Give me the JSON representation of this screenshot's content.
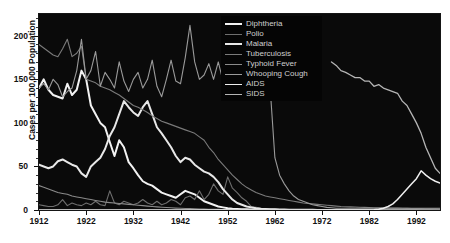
{
  "title_strip": "",
  "axes": {
    "ylabel": "Cases per 100,000 Population",
    "yticks": [
      0,
      50,
      100,
      150,
      200
    ],
    "xticks": [
      1912,
      1922,
      1932,
      1942,
      1952,
      1962,
      1972,
      1982,
      1992
    ],
    "xlim": [
      1912,
      1997
    ],
    "ylim": [
      0,
      225
    ],
    "plot_bg": "#0a0a0a",
    "tick_color": "#111111"
  },
  "legend": {
    "position": "top-center-right",
    "background": "#050505",
    "items": [
      {
        "label": "Diphtheria",
        "color": "#f2f2f2",
        "width": 2.0
      },
      {
        "label": "Polio",
        "color": "#6e6e6e",
        "width": 1.1
      },
      {
        "label": "Malaria",
        "color": "#e8e8e8",
        "width": 2.0
      },
      {
        "label": "Tuberculosis",
        "color": "#7a7a7a",
        "width": 1.1
      },
      {
        "label": "Typhoid Fever",
        "color": "#8a8a8a",
        "width": 1.1
      },
      {
        "label": "Whooping Cough",
        "color": "#9a9a9a",
        "width": 1.1
      },
      {
        "label": "AIDS",
        "color": "#efefef",
        "width": 1.5
      },
      {
        "label": "SIDS",
        "color": "#b5b5b5",
        "width": 1.3
      }
    ]
  },
  "chart_data": {
    "type": "line",
    "title": "",
    "xlabel": "",
    "ylabel": "Cases per 100,000 Population",
    "xlim": [
      1912,
      1997
    ],
    "ylim": [
      0,
      225
    ],
    "grid": false,
    "legend_position": "upper center",
    "x": [
      1912,
      1913,
      1914,
      1915,
      1916,
      1917,
      1918,
      1919,
      1920,
      1921,
      1922,
      1923,
      1924,
      1925,
      1926,
      1927,
      1928,
      1929,
      1930,
      1931,
      1932,
      1933,
      1934,
      1935,
      1936,
      1937,
      1938,
      1939,
      1940,
      1941,
      1942,
      1943,
      1944,
      1945,
      1946,
      1947,
      1948,
      1949,
      1950,
      1951,
      1952,
      1953,
      1954,
      1955,
      1956,
      1957,
      1958,
      1959,
      1960,
      1961,
      1962,
      1963,
      1964,
      1965,
      1966,
      1967,
      1968,
      1969,
      1970,
      1971,
      1972,
      1973,
      1974,
      1975,
      1976,
      1977,
      1978,
      1979,
      1980,
      1981,
      1982,
      1983,
      1984,
      1985,
      1986,
      1987,
      1988,
      1989,
      1990,
      1991,
      1992,
      1993,
      1994,
      1995,
      1996,
      1997
    ],
    "series": [
      {
        "name": "Diphtheria",
        "color": "#f2f2f2",
        "values": [
          140,
          150,
          138,
          132,
          130,
          128,
          145,
          132,
          138,
          160,
          150,
          120,
          110,
          100,
          95,
          78,
          62,
          80,
          72,
          55,
          48,
          40,
          33,
          30,
          28,
          24,
          20,
          18,
          16,
          14,
          18,
          22,
          20,
          18,
          14,
          10,
          8,
          6,
          4,
          3,
          2,
          1.5,
          1.2,
          1.0,
          0.8,
          0.6,
          0.5,
          0.4,
          0.3,
          0.2,
          0.2,
          0.1,
          0.1,
          0.1,
          0.1,
          0.1,
          0.1,
          0.1,
          0.1,
          0.05,
          0.05,
          0.02,
          0.02,
          0.01,
          0.01,
          0.01,
          0.01,
          0.01,
          0.01,
          0.01,
          0.01,
          0.01,
          0.01,
          0.01,
          0.01,
          0.01,
          0.01,
          0.01,
          0.01,
          0.01,
          0.01,
          0.01,
          0.01,
          0.01,
          0.01,
          0.01
        ]
      },
      {
        "name": "Polio",
        "color": "#6e6e6e",
        "values": [
          6,
          5,
          4,
          4,
          6,
          12,
          5,
          8,
          6,
          5,
          8,
          6,
          10,
          6,
          5,
          22,
          8,
          6,
          10,
          8,
          6,
          8,
          12,
          8,
          6,
          10,
          6,
          8,
          12,
          10,
          6,
          14,
          16,
          12,
          22,
          12,
          18,
          30,
          22,
          18,
          38,
          25,
          20,
          14,
          10,
          4,
          3,
          2,
          1,
          0.8,
          0.5,
          0.3,
          0.1,
          0.05,
          0.02,
          0.02,
          0.01,
          0.01,
          0.01,
          0.01,
          0.01,
          0.01,
          0.01,
          0.01,
          0.01,
          0.01,
          0.01,
          0.01,
          0.01,
          0.01,
          0.01,
          0.01,
          0.01,
          0.01,
          0.01,
          0.01,
          0.01,
          0.01,
          0.01,
          0.01,
          0.01,
          0.01,
          0.01,
          0.01,
          0.01,
          0.01
        ]
      },
      {
        "name": "Malaria",
        "color": "#e8e8e8",
        "values": [
          52,
          50,
          48,
          50,
          56,
          58,
          55,
          52,
          50,
          42,
          38,
          50,
          55,
          60,
          70,
          85,
          95,
          110,
          125,
          118,
          112,
          108,
          118,
          125,
          110,
          95,
          88,
          80,
          72,
          62,
          55,
          60,
          58,
          52,
          48,
          44,
          42,
          38,
          32,
          24,
          18,
          12,
          8,
          6,
          4,
          3,
          2,
          1.5,
          1.2,
          1.0,
          0.8,
          0.6,
          0.5,
          0.4,
          0.3,
          0.3,
          0.2,
          0.2,
          0.2,
          0.1,
          0.1,
          0.1,
          0.1,
          0.1,
          0.1,
          0.1,
          0.1,
          0.1,
          0.1,
          0.1,
          0.1,
          0.1,
          0.1,
          0.1,
          0.1,
          0.1,
          0.1,
          0.1,
          0.1,
          0.1,
          0.1,
          0.1,
          0.1,
          0.1,
          0.1,
          0.1
        ]
      },
      {
        "name": "Tuberculosis",
        "color": "#7a7a7a",
        "values": [
          190,
          186,
          182,
          178,
          176,
          185,
          196,
          176,
          180,
          188,
          150,
          148,
          146,
          142,
          140,
          138,
          135,
          132,
          128,
          124,
          120,
          118,
          115,
          112,
          108,
          105,
          102,
          100,
          98,
          96,
          94,
          92,
          90,
          88,
          84,
          80,
          72,
          66,
          58,
          52,
          46,
          40,
          35,
          30,
          26,
          23,
          20,
          18,
          16,
          15,
          14,
          13,
          12,
          11,
          10,
          9,
          8,
          7.5,
          7,
          6.5,
          6,
          5.5,
          5,
          4.5,
          4,
          3.8,
          3.6,
          3.4,
          3.2,
          3.0,
          2.8,
          2.6,
          2.5,
          2.4,
          2.3,
          2.2,
          2.1,
          2.0,
          1.9,
          1.8,
          1.7,
          1.6,
          1.5,
          1.4,
          1.3,
          1.2
        ]
      },
      {
        "name": "Typhoid Fever",
        "color": "#8a8a8a",
        "values": [
          28,
          26,
          24,
          22,
          20,
          19,
          18,
          16,
          15,
          14,
          13,
          12,
          11,
          10,
          9,
          8.5,
          8,
          7.5,
          7,
          6.5,
          6,
          5.5,
          5,
          4.5,
          4,
          3.6,
          3.2,
          2.8,
          2.5,
          2.2,
          2.0,
          1.8,
          1.6,
          1.4,
          1.2,
          1.0,
          0.9,
          0.8,
          0.7,
          0.6,
          0.5,
          0.45,
          0.4,
          0.35,
          0.3,
          0.28,
          0.26,
          0.24,
          0.22,
          0.2,
          0.2,
          0.18,
          0.16,
          0.15,
          0.14,
          0.13,
          0.12,
          0.11,
          0.1,
          0.1,
          0.1,
          0.1,
          0.1,
          0.1,
          0.1,
          0.1,
          0.1,
          0.1,
          0.1,
          0.1,
          0.1,
          0.1,
          0.1,
          0.1,
          0.1,
          0.1,
          0.1,
          0.1,
          0.1,
          0.1,
          0.1,
          0.1,
          0.1,
          0.1,
          0.1,
          0.1
        ]
      },
      {
        "name": "Whooping Cough",
        "color": "#9a9a9a",
        "values": [
          140,
          145,
          138,
          150,
          144,
          130,
          136,
          140,
          160,
          196,
          150,
          160,
          182,
          142,
          158,
          150,
          140,
          170,
          148,
          136,
          150,
          158,
          140,
          150,
          172,
          142,
          130,
          150,
          172,
          148,
          145,
          175,
          212,
          170,
          150,
          155,
          168,
          150,
          170,
          148,
          160,
          175,
          168,
          150,
          172,
          162,
          150,
          170,
          145,
          140,
          60,
          40,
          30,
          22,
          16,
          12,
          10,
          8,
          6,
          5,
          4,
          3,
          2.5,
          2,
          2,
          2,
          2,
          2,
          2,
          2,
          2,
          2,
          2,
          2,
          2,
          2,
          2,
          2,
          2,
          2,
          2,
          2,
          2,
          2,
          2,
          2
        ]
      },
      {
        "name": "AIDS",
        "color": "#efefef",
        "values": [
          0,
          0,
          0,
          0,
          0,
          0,
          0,
          0,
          0,
          0,
          0,
          0,
          0,
          0,
          0,
          0,
          0,
          0,
          0,
          0,
          0,
          0,
          0,
          0,
          0,
          0,
          0,
          0,
          0,
          0,
          0,
          0,
          0,
          0,
          0,
          0,
          0,
          0,
          0,
          0,
          0,
          0,
          0,
          0,
          0,
          0,
          0,
          0,
          0,
          0,
          0,
          0,
          0,
          0,
          0,
          0,
          0,
          0,
          0,
          0,
          0,
          0,
          0,
          0,
          0,
          0,
          0,
          0,
          0,
          0,
          0.1,
          0.3,
          0.8,
          2,
          4,
          7,
          12,
          18,
          24,
          30,
          36,
          45,
          40,
          36,
          33,
          31
        ]
      },
      {
        "name": "SIDS",
        "color": "#b5b5b5",
        "values": [
          null,
          null,
          null,
          null,
          null,
          null,
          null,
          null,
          null,
          null,
          null,
          null,
          null,
          null,
          null,
          null,
          null,
          null,
          null,
          null,
          null,
          null,
          null,
          null,
          null,
          null,
          null,
          null,
          null,
          null,
          null,
          null,
          null,
          null,
          null,
          null,
          null,
          null,
          null,
          null,
          null,
          null,
          null,
          null,
          null,
          null,
          null,
          null,
          null,
          null,
          null,
          null,
          null,
          null,
          null,
          null,
          null,
          null,
          null,
          null,
          null,
          null,
          170,
          166,
          160,
          158,
          155,
          152,
          152,
          148,
          148,
          142,
          144,
          140,
          138,
          136,
          134,
          125,
          120,
          110,
          100,
          88,
          72,
          60,
          48,
          42
        ]
      }
    ]
  }
}
